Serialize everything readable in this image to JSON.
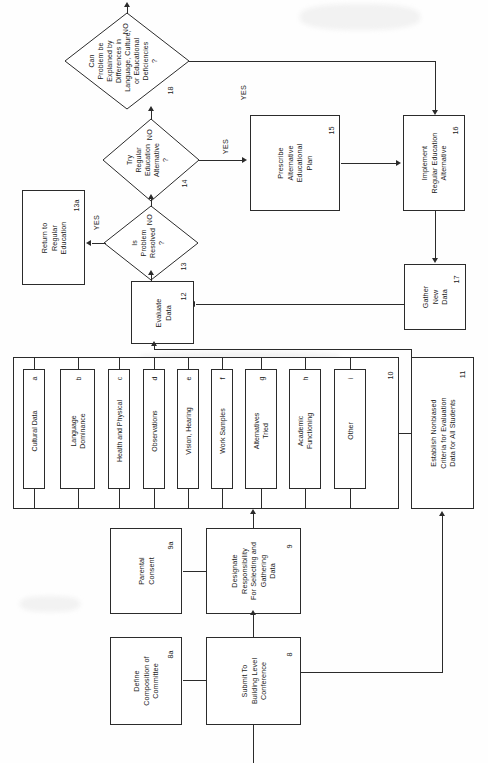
{
  "diagram": {
    "orientation": "rotated-90-ccw",
    "line_color": "#2b2b2b",
    "background_color": "#fefefe"
  },
  "nodes": {
    "n8a": {
      "ref": "8a",
      "label": "Define\nComposition of\nCommittee"
    },
    "n8": {
      "ref": "8",
      "label": "Submit To\nBuilding Level\nConference"
    },
    "n9a": {
      "ref": "9a",
      "label": "Parental\nConsent"
    },
    "n9": {
      "ref": "9",
      "label": "Designate\nResponsibility\nFor Selecting and\nGathering\nData"
    },
    "n10": {
      "ref": "10",
      "label": ""
    },
    "n11": {
      "ref": "11",
      "label": "Establish Nonbiased\nCriteria for Evaluation\nData for All Students"
    },
    "n12": {
      "ref": "12",
      "label": "Evaluate\nData"
    },
    "n13": {
      "ref": "13",
      "label": "Is\nProblem\nResolved\n?"
    },
    "n13a": {
      "ref": "13a",
      "label": "Return to\nRegular\nEducation"
    },
    "n14": {
      "ref": "14",
      "label": "Try\nRegular\nEducation\nAlternative\n?"
    },
    "n15": {
      "ref": "15",
      "label": "Prescribe\nAlternative\nEducational\nPlan"
    },
    "n16": {
      "ref": "16",
      "label": "Implement\nRegular Education\nAlternative"
    },
    "n17": {
      "ref": "17",
      "label": "Gather\nNew\nData"
    },
    "n18": {
      "ref": "18",
      "label": "Can\nProblem be\nExplained by\nDifferences in\nLanguage, Culture,\nor Educational\nDeficiencies\n?"
    }
  },
  "subcells": [
    {
      "ref": "a",
      "label": "Cultural Data"
    },
    {
      "ref": "b",
      "label": "Language\nDominance"
    },
    {
      "ref": "c",
      "label": "Health and Physical"
    },
    {
      "ref": "d",
      "label": "Observations"
    },
    {
      "ref": "e",
      "label": "Vision, Hearing"
    },
    {
      "ref": "f",
      "label": "Work Samples"
    },
    {
      "ref": "g",
      "label": "Alternatives\nTried"
    },
    {
      "ref": "h",
      "label": "Academic\nFunctioning"
    },
    {
      "ref": "i",
      "label": "Other"
    }
  ],
  "branch_labels": {
    "d13_yes": "YES",
    "d13_no": "NO",
    "d14_yes": "YES",
    "d14_no": "NO",
    "d18_yes": "YES",
    "d18_no": "NO"
  }
}
